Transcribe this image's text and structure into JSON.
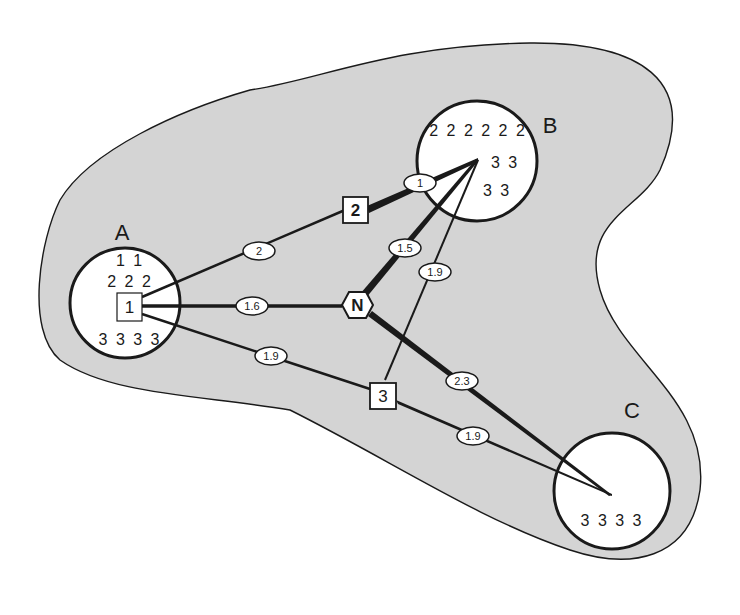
{
  "diagram": {
    "colors": {
      "region_fill": "#d4d4d4",
      "outline": "#1a1a1a",
      "circle_fill": "#ffffff"
    },
    "zones": [
      {
        "id": "A",
        "label": "A",
        "contents": [
          "1 1",
          "2 2 2",
          "3 3 3 3"
        ]
      },
      {
        "id": "B",
        "label": "B",
        "contents": [
          "2 2 2 2 2 2",
          "3 3",
          "3 3"
        ]
      },
      {
        "id": "C",
        "label": "C",
        "contents": [
          "3 3 3 3"
        ]
      }
    ],
    "nodes": [
      {
        "id": "1",
        "label": "1",
        "shape": "square"
      },
      {
        "id": "2",
        "label": "2",
        "shape": "square"
      },
      {
        "id": "3",
        "label": "3",
        "shape": "square"
      },
      {
        "id": "N",
        "label": "N",
        "shape": "hexagon"
      }
    ],
    "edges": [
      {
        "from": "1",
        "to": "2",
        "weight": "2"
      },
      {
        "from": "2",
        "to": "B",
        "weight": "1"
      },
      {
        "from": "1",
        "to": "N",
        "weight": "1.6"
      },
      {
        "from": "N",
        "to": "B",
        "weight": "1.5"
      },
      {
        "from": "3",
        "to": "B",
        "weight": "1.9"
      },
      {
        "from": "1",
        "to": "3",
        "weight": "1.9"
      },
      {
        "from": "N",
        "to": "C",
        "weight": "2.3"
      },
      {
        "from": "3",
        "to": "C",
        "weight": "1.9"
      }
    ]
  }
}
